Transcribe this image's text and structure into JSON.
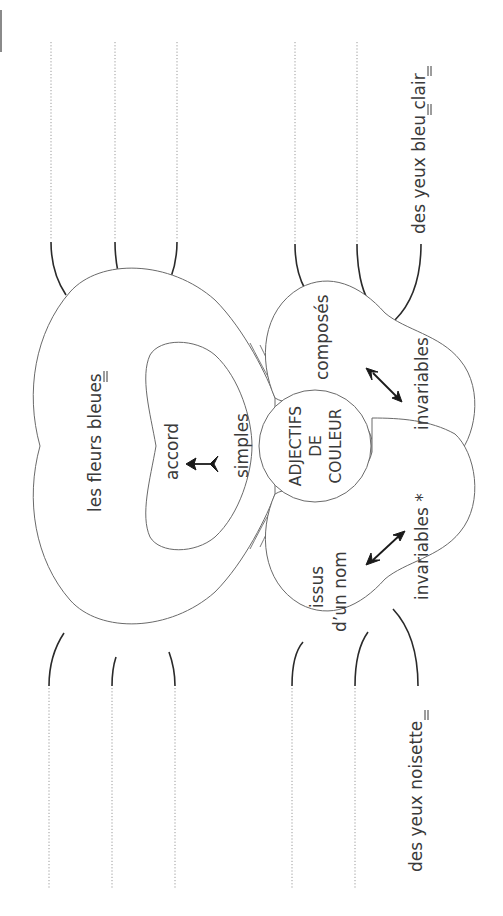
{
  "diagram": {
    "title": "Adjectifs de couleur",
    "center": {
      "lines": [
        "ADJECTIFS",
        "DE",
        "COULEUR"
      ]
    },
    "branches": {
      "simples": {
        "label": "simples",
        "rule": "accord",
        "example": "les fleurs bleues",
        "example_marked_letters": "s"
      },
      "composes": {
        "label": "composés",
        "rule": "invariables",
        "example": "des yeux bleu clair",
        "example_marked_letters": [
          "u",
          "r"
        ]
      },
      "issus_nom": {
        "label_line1": "issus",
        "label_line2": "d’un nom",
        "rule": "invariables *",
        "example": "des yeux noisette",
        "example_marked_letters": "e"
      }
    },
    "answer_lines": {
      "left_top": 3,
      "left_bottom": 3,
      "right_top": 2,
      "right_bottom": 2
    },
    "colors": {
      "outline": "#6a6a6a",
      "text": "#3a3a3a",
      "leader": "#2a2a2a",
      "dotted": "#9a9a9a"
    }
  }
}
